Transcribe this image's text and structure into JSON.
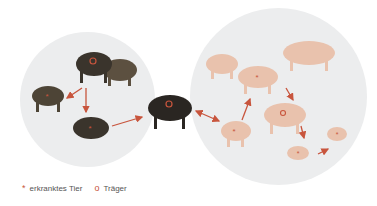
{
  "diagram": {
    "groups": [
      {
        "name": "wild-boar-population",
        "animals": [
          {
            "id": "boar-carrier-top",
            "marker": "carrier"
          },
          {
            "id": "boar-healthy-top",
            "marker": "none"
          },
          {
            "id": "boar-sick-left",
            "marker": "sick"
          },
          {
            "id": "boar-sick-bottom",
            "marker": "sick"
          }
        ]
      },
      {
        "name": "bridge",
        "animals": [
          {
            "id": "boar-carrier-center",
            "marker": "carrier"
          }
        ]
      },
      {
        "name": "domestic-pig-population",
        "animals": [
          {
            "id": "pig-healthy-1",
            "marker": "none"
          },
          {
            "id": "pig-healthy-2",
            "marker": "none"
          },
          {
            "id": "pig-sick-1",
            "marker": "sick"
          },
          {
            "id": "pig-sick-entry",
            "marker": "sick"
          },
          {
            "id": "pig-carrier",
            "marker": "carrier"
          },
          {
            "id": "piglet-sick-1",
            "marker": "sick"
          },
          {
            "id": "piglet-sick-2",
            "marker": "sick"
          }
        ]
      }
    ],
    "colors": {
      "arrow": "#c8553d",
      "circle": "#ecedee",
      "boar": "#3a342c",
      "pig": "#e9c2ad"
    }
  },
  "legend": {
    "sick": {
      "symbol": "*",
      "label": "erkranktes Tier"
    },
    "carrier": {
      "symbol": "o",
      "label": "Träger"
    }
  }
}
